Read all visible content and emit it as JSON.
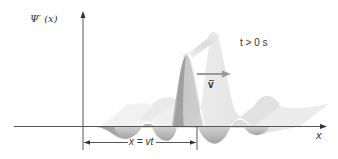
{
  "diagram": {
    "y_axis_label": "Ψ′ (x)",
    "x_axis_label": "x",
    "time_label": "t > 0 s",
    "velocity_label": "v",
    "displacement_label": "x = vt",
    "colors": {
      "axis": "#555555",
      "ribbon_light": "#f2f2f2",
      "ribbon_mid": "#d0d0d0",
      "ribbon_dark": "#9a9a9a",
      "velocity_arrow": "#9a9a9a",
      "text": "#333333"
    }
  }
}
